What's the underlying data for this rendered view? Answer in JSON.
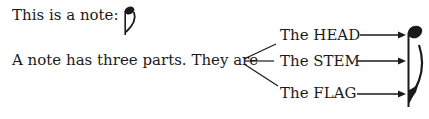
{
  "intro": {
    "line1": "This is a note:",
    "line2": "A note has three parts.  They are"
  },
  "parts": [
    {
      "label": "The HEAD"
    },
    {
      "label": "The STEM"
    },
    {
      "label": "The FLAG"
    }
  ],
  "icons": {
    "small_note": "eighth-note-icon",
    "large_note": "eighth-note-icon"
  },
  "colors": {
    "ink": "#1a1a1a",
    "paper": "#ffffff"
  }
}
